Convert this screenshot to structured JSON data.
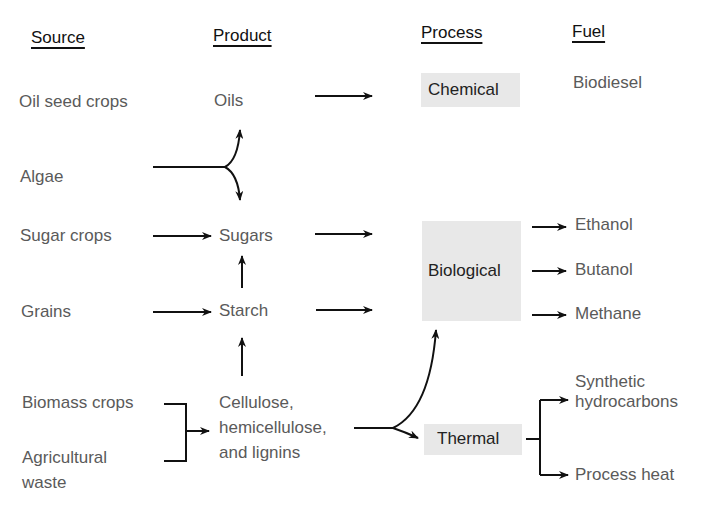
{
  "headers": {
    "source": "Source",
    "product": "Product",
    "process": "Process",
    "fuel": "Fuel"
  },
  "sources": {
    "oil_seed_crops": "Oil seed crops",
    "algae": "Algae",
    "sugar_crops": "Sugar crops",
    "grains": "Grains",
    "biomass_crops": "Biomass crops",
    "agricultural_waste_line1": "Agricultural",
    "agricultural_waste_line2": "waste"
  },
  "products": {
    "oils": "Oils",
    "sugars": "Sugars",
    "starch": "Starch",
    "lignocellulose_line1": "Cellulose,",
    "lignocellulose_line2": "hemicellulose,",
    "lignocellulose_line3": "and lignins"
  },
  "processes": {
    "chemical": "Chemical",
    "biological": "Biological",
    "thermal": "Thermal"
  },
  "fuels": {
    "biodiesel": "Biodiesel",
    "ethanol": "Ethanol",
    "butanol": "Butanol",
    "methane": "Methane",
    "synthetic_line1": "Synthetic",
    "synthetic_line2": "hydrocarbons",
    "process_heat": "Process heat"
  },
  "colors": {
    "process_box": "#e8e8e8",
    "arrow": "#111111"
  }
}
